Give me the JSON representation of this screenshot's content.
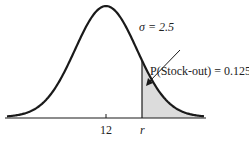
{
  "diagram": {
    "type": "normal-distribution",
    "mean_label": "12",
    "sigma_label": "σ = 2.5",
    "reorder_label": "r",
    "annotation": "P(Stock-out) = 0.125",
    "mean": 12,
    "sigma": 2.5,
    "stockout_probability": 0.125,
    "shade_color": "#dcdcdc",
    "curve_color": "#1a1a1a"
  }
}
